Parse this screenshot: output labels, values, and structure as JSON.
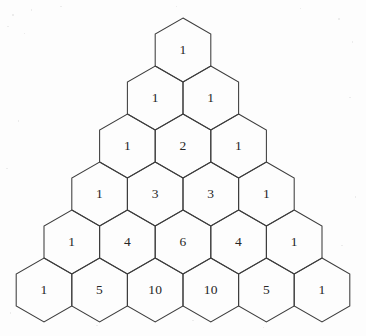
{
  "figure": {
    "background_color": "#fdfdfd",
    "stroke_color": "#3d3d3d",
    "text_color": "#262626"
  },
  "geometry": {
    "hex_width": 55.6,
    "hex_height": 64,
    "row_pitch": 48,
    "origin_x": 183,
    "origin_y": 50,
    "rows": 6
  },
  "chart_data": {
    "type": "table",
    "xlabel": "",
    "ylabel": "",
    "rows": [
      {
        "row_index": 0,
        "values": [
          1
        ]
      },
      {
        "row_index": 1,
        "values": [
          1,
          1
        ]
      },
      {
        "row_index": 2,
        "values": [
          1,
          2,
          1
        ]
      },
      {
        "row_index": 3,
        "values": [
          1,
          3,
          3,
          1
        ]
      },
      {
        "row_index": 4,
        "values": [
          1,
          4,
          6,
          4,
          1
        ]
      },
      {
        "row_index": 5,
        "values": [
          1,
          5,
          10,
          10,
          5,
          1
        ]
      }
    ]
  }
}
